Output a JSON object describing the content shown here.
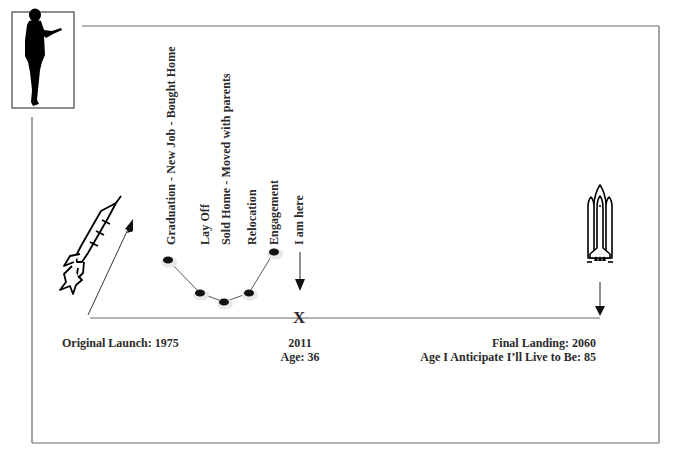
{
  "diagram": {
    "icons": {
      "person": "presenter-silhouette-icon",
      "launch": "rocket-icon",
      "landing": "space-shuttle-icon"
    },
    "events": [
      {
        "label": "Graduation - New Job - Bought Home",
        "x": 168,
        "y": 260
      },
      {
        "label": "Lay Off",
        "x": 200,
        "y": 293
      },
      {
        "label": "Sold Home - Moved with parents",
        "x": 224,
        "y": 302
      },
      {
        "label": "Relocation",
        "x": 249,
        "y": 293
      },
      {
        "label": "Engagement",
        "x": 274,
        "y": 252
      }
    ],
    "current": {
      "label": "I am here",
      "marker": "X",
      "year": "2011",
      "age": "Age:  36"
    },
    "launch": {
      "label": "Original Launch: 1975"
    },
    "landing": {
      "label": "Final Landing: 2060",
      "age_label": "Age I Anticipate I’ll Live to Be: 85"
    },
    "colors": {
      "line": "#555555",
      "frame": "#666666",
      "text": "#2a2a2a",
      "bullet": "#111111"
    }
  }
}
